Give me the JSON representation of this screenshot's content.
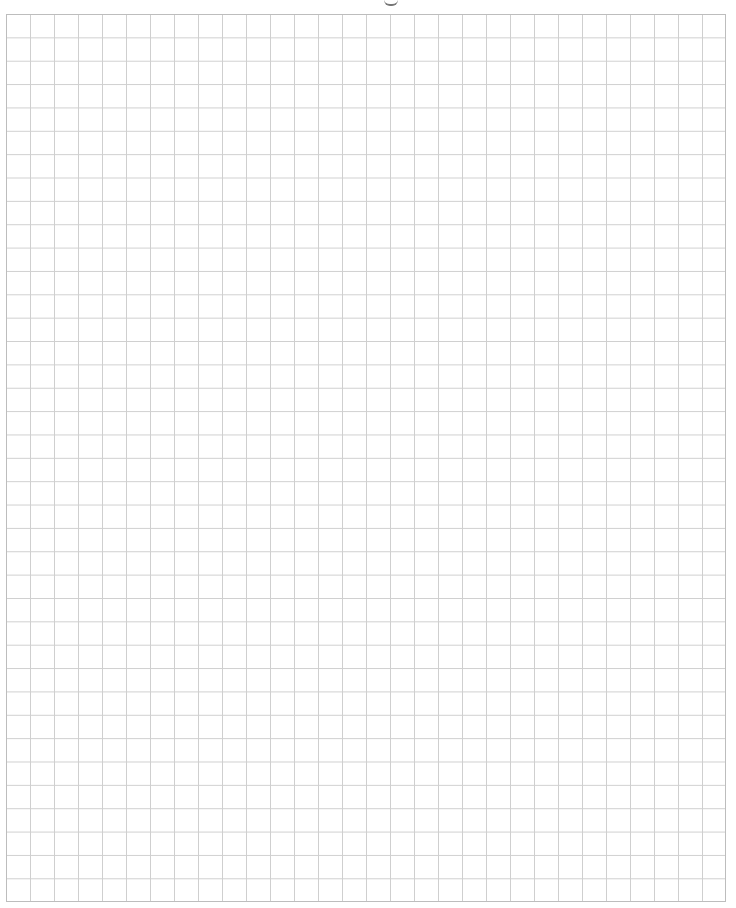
{
  "document": {
    "type": "graph-paper",
    "grid": {
      "columns": 30,
      "rows": 38,
      "cell_width_px": 24,
      "cell_height_px": 23.37,
      "line_color": "#cfcfcf",
      "border_color": "#bdbdbd",
      "background_color": "#ffffff"
    },
    "header_fragment": ""
  }
}
